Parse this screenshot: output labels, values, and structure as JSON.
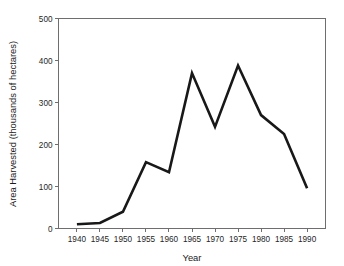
{
  "chart_data": {
    "type": "line",
    "title": "",
    "subtitle": "",
    "xlabel": "Year",
    "ylabel": "Area Harvested (thousands of hectares)",
    "x": [
      1940,
      1945,
      1950,
      1955,
      1960,
      1965,
      1970,
      1975,
      1980,
      1985,
      1990
    ],
    "values": [
      10,
      13,
      40,
      158,
      134,
      370,
      242,
      388,
      270,
      225,
      96
    ],
    "series": [
      {
        "name": "Area Harvested",
        "values": [
          10,
          13,
          40,
          158,
          134,
          370,
          242,
          388,
          270,
          225,
          96
        ]
      }
    ],
    "xlim": [
      1936,
      1994
    ],
    "ylim": [
      0,
      500
    ],
    "xticks": [
      1940,
      1945,
      1950,
      1955,
      1960,
      1965,
      1970,
      1975,
      1980,
      1985,
      1990
    ],
    "xtick_labels": [
      "1940",
      "1945",
      "1950",
      "1955",
      "1960",
      "1965",
      "1970",
      "1975",
      "1980",
      "1985",
      "1990"
    ],
    "yticks": [
      0,
      100,
      200,
      300,
      400,
      500
    ],
    "ytick_labels": [
      "0",
      "100",
      "200",
      "300",
      "400",
      "500"
    ],
    "grid": false,
    "legend": false,
    "legend_position": "none",
    "line_color": "#181818",
    "axis_color": "#6e6e6e",
    "background_color": "#ffffff"
  }
}
